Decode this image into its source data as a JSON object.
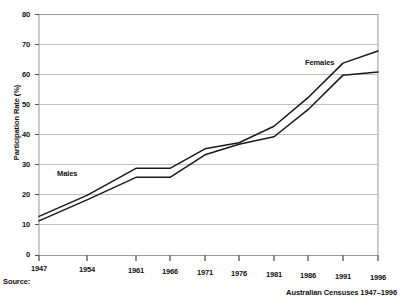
{
  "chart_data": {
    "type": "line",
    "title": "",
    "xlabel": "",
    "ylabel": "Participation Rate (%)",
    "ylim": [
      0,
      80
    ],
    "ytick_step": 10,
    "yticks": [
      0,
      10,
      20,
      30,
      40,
      50,
      60,
      70,
      80
    ],
    "xticks": [
      1947,
      1954,
      1961,
      1966,
      1971,
      1976,
      1981,
      1986,
      1991,
      1996
    ],
    "xlim": [
      1947,
      1996
    ],
    "grid": "horizontal",
    "legend": "inline-labels",
    "series": [
      {
        "name": "Males",
        "x": [
          1947,
          1954,
          1961,
          1966,
          1971,
          1976,
          1981,
          1986,
          1991,
          1996
        ],
        "values": [
          11.5,
          18.5,
          26.0,
          26.0,
          33.5,
          37.0,
          39.5,
          48.5,
          60.0,
          61.0
        ]
      },
      {
        "name": "Females",
        "x": [
          1947,
          1954,
          1961,
          1966,
          1971,
          1976,
          1981,
          1986,
          1991,
          1996
        ],
        "values": [
          13.0,
          20.0,
          29.0,
          29.0,
          35.5,
          37.5,
          43.0,
          52.5,
          64.0,
          68.0
        ]
      }
    ],
    "annotations": [
      {
        "text": "Males",
        "x": 1949.5,
        "y": 22.5
      },
      {
        "text": "Females",
        "x": 1981.5,
        "y": 65.0
      }
    ],
    "colors": {
      "line": "#1a1a1a",
      "grid": "#b8b8b8",
      "frame": "#9a9a9a",
      "background": "#ffffff"
    }
  },
  "footer": {
    "source_label": "Source:",
    "source_value": "Australian Censuses 1947–1996"
  },
  "axis": {
    "y_title": "Participation Rate (%)",
    "y_labels": [
      "80",
      "70",
      "60",
      "50",
      "40",
      "30",
      "20",
      "10",
      "0"
    ],
    "x_labels": [
      "1947",
      "1954",
      "1961",
      "1966",
      "1971",
      "1976",
      "1981",
      "1986",
      "1991",
      "1996"
    ]
  },
  "series_labels": {
    "males": "Males",
    "females": "Females"
  }
}
